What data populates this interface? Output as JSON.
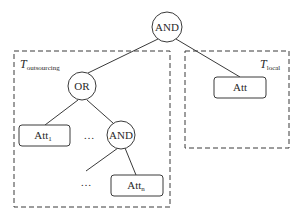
{
  "diagram": {
    "type": "access-tree",
    "colors": {
      "stroke": "#3a3a3a",
      "background": "#ffffff"
    },
    "regions": {
      "outsourcing": {
        "label_main": "T",
        "label_sub": "outsourcing"
      },
      "local": {
        "label_main": "T",
        "label_sub": "local"
      }
    },
    "nodes": {
      "root": {
        "kind": "gate",
        "label": "AND"
      },
      "or": {
        "kind": "gate",
        "label": "OR"
      },
      "and2": {
        "kind": "gate",
        "label": "AND"
      },
      "att_local": {
        "kind": "leaf",
        "label": "Att"
      },
      "att_1": {
        "kind": "leaf",
        "label": "Att",
        "sub": "1"
      },
      "att_n": {
        "kind": "leaf",
        "label": "Att",
        "sub": "n"
      },
      "ellipsis_1": {
        "label": "…"
      },
      "ellipsis_2": {
        "label": "…"
      }
    },
    "edges": [
      [
        "root",
        "or"
      ],
      [
        "root",
        "att_local"
      ],
      [
        "or",
        "att_1"
      ],
      [
        "or",
        "and2"
      ],
      [
        "and2",
        "ellipsis_2"
      ],
      [
        "and2",
        "att_n"
      ]
    ]
  }
}
